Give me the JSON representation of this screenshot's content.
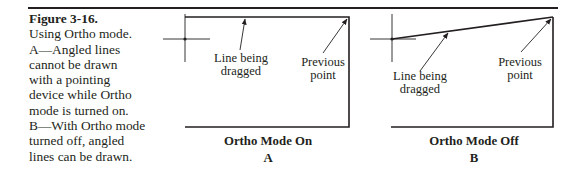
{
  "caption": {
    "figure_number": "Figure 3-16.",
    "lines": [
      "Using Ortho mode.",
      "A—Angled lines",
      "cannot be drawn",
      "with a pointing",
      "device while Ortho",
      "mode is turned on.",
      "B—With Ortho mode",
      "turned off, angled",
      "lines can be drawn."
    ]
  },
  "panels": [
    {
      "id": "A",
      "title": "Ortho Mode On",
      "letter": "A",
      "labels": {
        "dragged_line_1": "Line being",
        "dragged_line_2": "dragged",
        "previous_1": "Previous",
        "previous_2": "point"
      }
    },
    {
      "id": "B",
      "title": "Ortho Mode Off",
      "letter": "B",
      "labels": {
        "dragged_line_1": "Line being",
        "dragged_line_2": "dragged",
        "previous_1": "Previous",
        "previous_2": "point"
      }
    }
  ]
}
